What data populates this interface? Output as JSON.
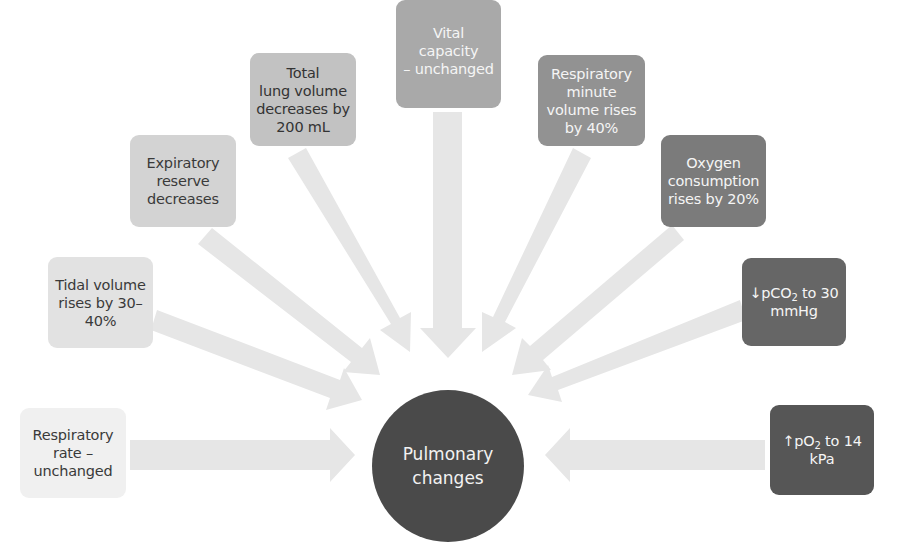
{
  "diagram": {
    "type": "radial-hub-and-spoke",
    "center": {
      "label": "Pulmonary\nchanges",
      "color": "#4a4a4a",
      "text_color": "#f2f2f2"
    },
    "arrow_color": "#e6e6e6",
    "nodes": [
      {
        "id": "respiratory-rate",
        "label": "Respiratory\nrate –\nunchanged",
        "color": "#f0f0f0",
        "text_color": "#3a3a3a"
      },
      {
        "id": "tidal-volume",
        "label": "Tidal volume\nrises by 30–\n40%",
        "color": "#e2e2e2",
        "text_color": "#3a3a3a"
      },
      {
        "id": "expiratory-reserve",
        "label": "Expiratory\nreserve\ndecreases",
        "color": "#d3d3d3",
        "text_color": "#3a3a3a"
      },
      {
        "id": "total-lung-volume",
        "label": "Total\nlung volume\ndecreases by\n200 mL",
        "color": "#c2c2c2",
        "text_color": "#333333"
      },
      {
        "id": "vital-capacity",
        "label": "Vital capacity\n– unchanged",
        "color": "#a9a9a9",
        "text_color": "#f5f5f5"
      },
      {
        "id": "respiratory-minute-volume",
        "label": "Respiratory\nminute\nvolume rises\nby 40%",
        "color": "#929292",
        "text_color": "#f5f5f5"
      },
      {
        "id": "oxygen-consumption",
        "label": "Oxygen\nconsumption\nrises by 20%",
        "color": "#7b7b7b",
        "text_color": "#f5f5f5"
      },
      {
        "id": "pco2",
        "label_prefix": "↓pCO",
        "label_sub": "2",
        "label_suffix": " to 30\nmmHg",
        "color": "#666666",
        "text_color": "#f5f5f5"
      },
      {
        "id": "po2",
        "label_prefix": "↑pO",
        "label_sub": "2",
        "label_suffix": " to 14\nkPa",
        "color": "#565656",
        "text_color": "#f5f5f5"
      }
    ]
  }
}
